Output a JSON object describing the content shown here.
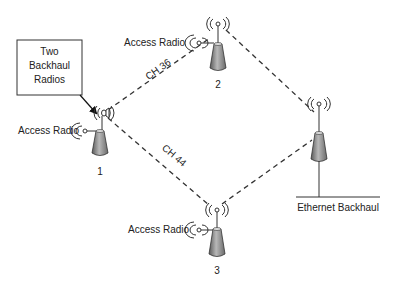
{
  "diagram": {
    "callout": {
      "lines": [
        "Two",
        "Backhaul",
        "Radios"
      ]
    },
    "nodes": [
      {
        "id": "1",
        "label": "1",
        "access_label": "Access Radio"
      },
      {
        "id": "2",
        "label": "2",
        "access_label": "Access Radio"
      },
      {
        "id": "3",
        "label": "3",
        "access_label": "Access Radio"
      },
      {
        "id": "gateway",
        "label": "Ethernet Backhaul"
      }
    ],
    "links": [
      {
        "from": "1",
        "to": "2",
        "label": "CH 36",
        "style": "dashed"
      },
      {
        "from": "1",
        "to": "3",
        "label": "CH 44",
        "style": "dashed"
      },
      {
        "from": "2",
        "to": "gateway",
        "label": "",
        "style": "dashed"
      },
      {
        "from": "3",
        "to": "gateway",
        "label": "",
        "style": "dashed"
      }
    ],
    "colors": {
      "line": "#333333",
      "text": "#222222",
      "tower_dark": "#555555",
      "tower_light": "#bdbdbd"
    }
  }
}
